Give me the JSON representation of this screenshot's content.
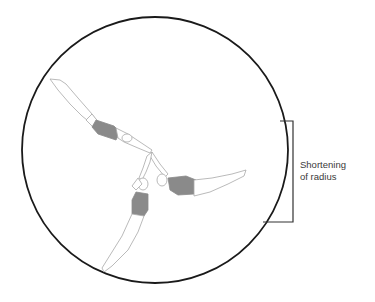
{
  "diagram": {
    "annotation": {
      "line1": "Shortening",
      "line2": "of radius"
    },
    "elements": {
      "circle": {
        "cx": 155,
        "cy": 150,
        "r": 133,
        "stroke": "#1a1a1a"
      },
      "bracket": {
        "top_y": 121,
        "bottom_y": 222,
        "right_x": 293,
        "stroke": "#333333"
      },
      "figures": [
        {
          "name": "swimmer-upper-left",
          "suit_color": "#8a8a8a"
        },
        {
          "name": "swimmer-right",
          "suit_color": "#8a8a8a"
        },
        {
          "name": "swimmer-lower",
          "suit_color": "#8a8a8a"
        }
      ],
      "outline_color": "#aaaaaa"
    }
  }
}
